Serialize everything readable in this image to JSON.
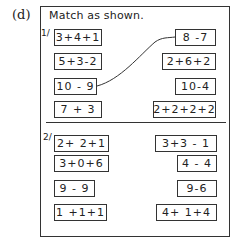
{
  "part_label": "(d)",
  "instruction": "Match as shown.",
  "sets": [
    {
      "number": "1/",
      "left": [
        "3+4+1",
        "5+3-2",
        "10 - 9",
        "7 + 3"
      ],
      "right": [
        "8 -7",
        "2+6+2",
        "10-4",
        "2+2+2+2"
      ],
      "example_match": {
        "from": "10 - 9",
        "to": "8 -7"
      }
    },
    {
      "number": "2/",
      "left": [
        "2+ 2+1",
        "3+0+6",
        "9 - 9",
        "1 +1+1"
      ],
      "right": [
        "3+3 - 1",
        "4 - 4",
        "9-6",
        "4+ 1+4"
      ]
    }
  ]
}
